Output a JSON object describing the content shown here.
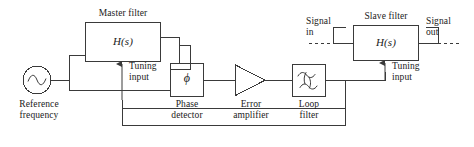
{
  "diagram": {
    "type": "block-diagram",
    "stroke_color": "#3a3a3a",
    "text_color": "#1a1a1a",
    "background": "#ffffff"
  },
  "blocks": {
    "master_filter": {
      "caption": "Master filter",
      "symbol": "H(s)",
      "tuning_label": "Tuning\ninput"
    },
    "slave_filter": {
      "caption": "Slave filter",
      "symbol": "H(s)",
      "tuning_label": "Tuning\ninput"
    },
    "phase_detector": {
      "caption": "Phase\ndetector",
      "symbol": "ϕ"
    },
    "error_amplifier": {
      "caption": "Error\namplifier",
      "symbol": "triangle-amplifier"
    },
    "loop_filter": {
      "caption": "Loop\nfilter",
      "symbol": "filter-response-curves"
    },
    "reference_source": {
      "caption": "Reference\nfrequency",
      "symbol": "sine-source"
    }
  },
  "ports": {
    "signal_in": "Signal\nin",
    "signal_out": "Signal\nout"
  }
}
